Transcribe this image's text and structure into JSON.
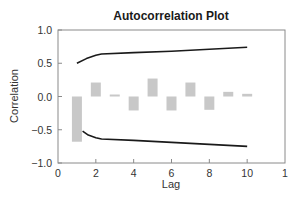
{
  "chart_data": {
    "type": "bar",
    "title": "Autocorrelation Plot",
    "xlabel": "Lag",
    "ylabel": "Correlation",
    "xlim": [
      0,
      12
    ],
    "ylim": [
      -1.0,
      1.0
    ],
    "x_ticks": [
      "0",
      "2",
      "4",
      "6",
      "8",
      "10",
      "1"
    ],
    "y_ticks": [
      "1.0",
      "0.5",
      "0.0",
      "−0.5",
      "−1.0"
    ],
    "grid": false,
    "categories": [
      1,
      2,
      3,
      4,
      5,
      6,
      7,
      8,
      9,
      10
    ],
    "series": [
      {
        "name": "Autocorrelation",
        "values": [
          -0.68,
          0.21,
          0.03,
          -0.21,
          0.27,
          -0.21,
          0.21,
          -0.2,
          0.07,
          0.04
        ],
        "color": "#c8c8c8"
      },
      {
        "name": "Upper confidence bound",
        "type": "line",
        "x": [
          1,
          1.5,
          2,
          2.3,
          4,
          6,
          8,
          10
        ],
        "values": [
          0.5,
          0.57,
          0.62,
          0.64,
          0.66,
          0.68,
          0.71,
          0.74
        ],
        "color": "#1a1a1a"
      },
      {
        "name": "Lower confidence bound",
        "type": "line",
        "x": [
          1.3,
          1.6,
          2,
          2.3,
          4,
          6,
          8,
          10
        ],
        "values": [
          -0.52,
          -0.58,
          -0.62,
          -0.64,
          -0.66,
          -0.69,
          -0.72,
          -0.75
        ],
        "color": "#1a1a1a"
      }
    ]
  }
}
